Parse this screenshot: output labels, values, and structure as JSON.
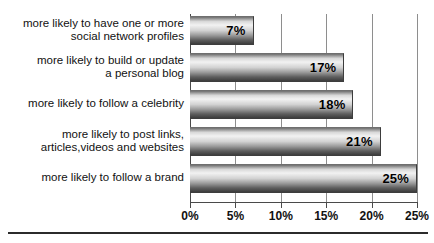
{
  "chart_data": {
    "type": "bar",
    "orientation": "horizontal",
    "title": "",
    "xlabel": "",
    "ylabel": "",
    "xlim": [
      0,
      25
    ],
    "grid": true,
    "legend": false,
    "value_suffix": "%",
    "categories": [
      "more likely to have one or more\nsocial network profiles",
      "more likely to build or update\na personal blog",
      "more likely to follow a celebrity",
      "more likely to post links,\narticles,videos and websites",
      "more likely to follow a brand"
    ],
    "values": [
      7,
      17,
      18,
      21,
      25
    ],
    "data_labels": [
      "7%",
      "17%",
      "18%",
      "21%",
      "25%"
    ],
    "xticks": [
      0,
      5,
      10,
      15,
      20,
      25
    ],
    "xtick_labels": [
      "0%",
      "5%",
      "10%",
      "15%",
      "20%",
      "25%"
    ],
    "colors": {
      "bar_gradient_light": "#f2f2f2",
      "bar_gradient_dark": "#3c3c3c",
      "gridline": "#8e8e8e",
      "axis": "#4a4a4a",
      "text": "#111111",
      "background": "#ffffff"
    }
  },
  "rows": [
    {
      "label": "more likely to have one or more\nsocial network profiles",
      "value": 7,
      "value_label": "7%"
    },
    {
      "label": "more likely to build or update\na personal blog",
      "value": 17,
      "value_label": "17%"
    },
    {
      "label": "more likely to follow a celebrity",
      "value": 18,
      "value_label": "18%"
    },
    {
      "label": "more likely to post links,\narticles,videos and websites",
      "value": 21,
      "value_label": "21%"
    },
    {
      "label": "more likely to follow a brand",
      "value": 25,
      "value_label": "25%"
    }
  ],
  "xticks": [
    {
      "label": "0%",
      "value": 0
    },
    {
      "label": "5%",
      "value": 5
    },
    {
      "label": "10%",
      "value": 10
    },
    {
      "label": "15%",
      "value": 15
    },
    {
      "label": "20%",
      "value": 20
    },
    {
      "label": "25%",
      "value": 25
    }
  ]
}
